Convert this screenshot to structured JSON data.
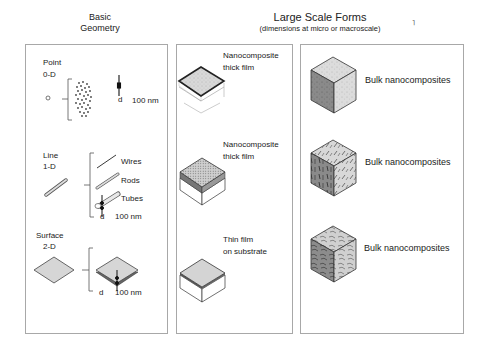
{
  "headers": {
    "basic_geometry": [
      "Basic",
      "Geometry"
    ],
    "large_scale": {
      "title": "Large Scale Forms",
      "subtitle": "(dimensions at micro or macroscale)"
    }
  },
  "basic_geometry": {
    "point": {
      "name": "Point",
      "dim": "0-D",
      "d_label": "d",
      "size": "100 nm"
    },
    "line": {
      "name": "Line",
      "dim": "1-D",
      "types": [
        "Wires",
        "Rods",
        "Tubes"
      ],
      "d_label": "d",
      "size": "100 nm"
    },
    "surface": {
      "name": "Surface",
      "dim": "2-D",
      "d_label": "d",
      "size": "100 nm"
    }
  },
  "films": [
    {
      "label_line1": "Nanocomposite",
      "label_line2": "thick film"
    },
    {
      "label_line1": "Nanocomposite",
      "label_line2": "thick film"
    },
    {
      "label_line1": "Thin film",
      "label_line2": "on substrate"
    }
  ],
  "bulk": [
    {
      "label": "Bulk nanocomposites"
    },
    {
      "label": "Bulk nanocomposites"
    },
    {
      "label": "Bulk nanocomposites"
    }
  ],
  "colors": {
    "panel_border": "#a8a8a8",
    "fill_gray": "#d4d4d4",
    "dark_gray": "#7a7a7a",
    "line": "#333333"
  }
}
